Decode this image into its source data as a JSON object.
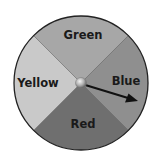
{
  "spinner": {
    "sections": [
      {
        "label": "Green",
        "position": "top",
        "color": "#a7a7a7"
      },
      {
        "label": "Blue",
        "position": "right",
        "color": "#8f8f8f"
      },
      {
        "label": "Red",
        "position": "bottom",
        "color": "#6f6f6f"
      },
      {
        "label": "Yellow",
        "position": "left",
        "color": "#c9c9c9"
      }
    ],
    "pointer": {
      "points_to": "Blue",
      "color": "#111111"
    },
    "hub_color": "#b8b8b8",
    "border_color": "#222222"
  }
}
